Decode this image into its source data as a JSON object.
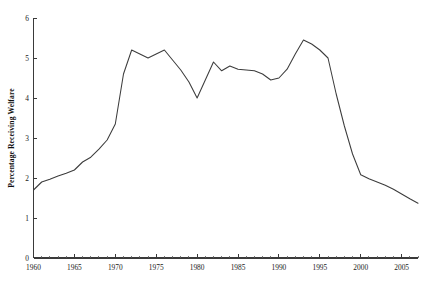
{
  "chart_data": {
    "type": "line",
    "title": "",
    "xlabel": "",
    "ylabel": "Percentage Receiving Welfare",
    "xlim": [
      1960,
      2007
    ],
    "ylim": [
      0,
      6
    ],
    "grid": false,
    "legend": "none",
    "x_tick_labels": [
      "1960",
      "1965",
      "1970",
      "1975",
      "1980",
      "1985",
      "1990",
      "1995",
      "2000",
      "2005"
    ],
    "x_tick_values": [
      1960,
      1965,
      1970,
      1975,
      1980,
      1985,
      1990,
      1995,
      2000,
      2005
    ],
    "x_minor_tick_step": 1,
    "y_tick_labels": [
      "0",
      "1",
      "2",
      "3",
      "4",
      "5",
      "6"
    ],
    "y_tick_values": [
      0,
      1,
      2,
      3,
      4,
      5,
      6
    ],
    "line_color": "#3c3c3c",
    "x": [
      1960,
      1961,
      1962,
      1963,
      1964,
      1965,
      1966,
      1967,
      1968,
      1969,
      1970,
      1971,
      1972,
      1973,
      1974,
      1975,
      1976,
      1977,
      1978,
      1979,
      1980,
      1981,
      1982,
      1983,
      1984,
      1985,
      1986,
      1987,
      1988,
      1989,
      1990,
      1991,
      1992,
      1993,
      1994,
      1995,
      1996,
      1997,
      1998,
      1999,
      2000,
      2001,
      2002,
      2003,
      2004,
      2005,
      2006,
      2007
    ],
    "values": [
      1.7,
      1.9,
      1.97,
      2.05,
      2.12,
      2.2,
      2.4,
      2.52,
      2.72,
      2.95,
      3.35,
      4.6,
      5.2,
      5.1,
      5.0,
      5.1,
      5.2,
      4.95,
      4.7,
      4.4,
      4.0,
      4.45,
      4.9,
      4.68,
      4.8,
      4.72,
      4.7,
      4.68,
      4.6,
      4.45,
      4.5,
      4.72,
      5.1,
      5.45,
      5.35,
      5.2,
      5.0,
      4.1,
      3.3,
      2.6,
      2.08,
      1.98,
      1.9,
      1.82,
      1.72,
      1.6,
      1.48,
      1.37
    ],
    "series": [
      {
        "name": "Percentage Receiving Welfare",
        "values": [
          1.7,
          1.9,
          1.97,
          2.05,
          2.12,
          2.2,
          2.4,
          2.52,
          2.72,
          2.95,
          3.35,
          4.6,
          5.2,
          5.1,
          5.0,
          5.1,
          5.2,
          4.95,
          4.7,
          4.4,
          4.0,
          4.45,
          4.9,
          4.68,
          4.8,
          4.72,
          4.7,
          4.68,
          4.6,
          4.45,
          4.5,
          4.72,
          5.1,
          5.45,
          5.35,
          5.2,
          5.0,
          4.1,
          3.3,
          2.6,
          2.08,
          1.98,
          1.9,
          1.82,
          1.72,
          1.6,
          1.48,
          1.37
        ]
      }
    ],
    "annotations": []
  }
}
